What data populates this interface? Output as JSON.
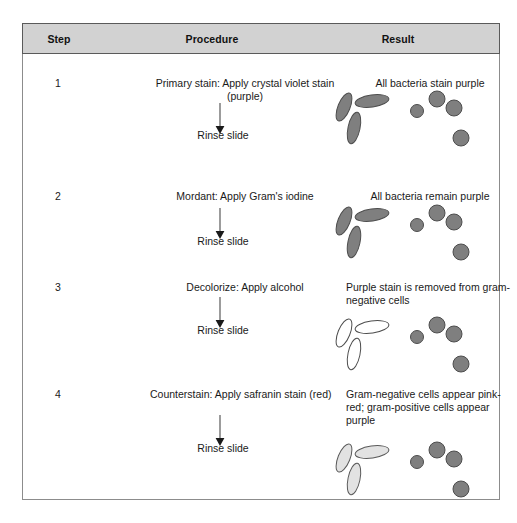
{
  "figure": {
    "type": "procedure-table",
    "colors": {
      "header_band": "#d2d2d2",
      "frame_border": "#8c8c8c",
      "cell_purple": "#7f7f7f",
      "cell_pink": "#e2e2e2",
      "cell_clear": "#ffffff",
      "text": "#1a1a1a"
    }
  },
  "table": {
    "columns": [
      {
        "key": "step",
        "label": "Step"
      },
      {
        "key": "procedure",
        "label": "Procedure"
      },
      {
        "key": "result",
        "label": "Result"
      }
    ],
    "rows": [
      {
        "step": "1",
        "procedure": "Primary stain: Apply crystal violet stain (purple)",
        "arrow_label": "down-arrow",
        "rinse": "Rinse slide",
        "result": "All bacteria stain purple",
        "rods_fill": "purple",
        "cocci_fill": "purple"
      },
      {
        "step": "2",
        "procedure": "Mordant: Apply Gram's iodine",
        "arrow_label": "down-arrow",
        "rinse": "Rinse slide",
        "result": "All bacteria remain purple",
        "rods_fill": "purple",
        "cocci_fill": "purple"
      },
      {
        "step": "3",
        "procedure": "Decolorize: Apply alcohol",
        "arrow_label": "down-arrow",
        "rinse": "Rinse slide",
        "result": "Purple stain is removed from gram-negative cells",
        "rods_fill": "clear",
        "cocci_fill": "purple"
      },
      {
        "step": "4",
        "procedure": "Counterstain: Apply safranin stain (red)",
        "arrow_label": "down-arrow",
        "rinse": "Rinse slide",
        "result": "Gram-negative cells appear pink-red; gram-positive cells appear purple",
        "rods_fill": "pink",
        "cocci_fill": "purple"
      }
    ]
  },
  "legend_notes": {
    "rods": "gram-negative rod-shaped bacteria (bacilli)",
    "cocci": "gram-positive round bacteria (cocci)"
  }
}
